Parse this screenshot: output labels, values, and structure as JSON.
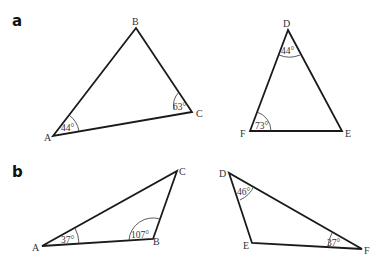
{
  "panels": [
    {
      "label": "a",
      "triangles": [
        {
          "vertices": {
            "A": "A",
            "B": "B",
            "C": "C"
          },
          "angles": [
            {
              "at": "A",
              "value": "44°"
            },
            {
              "at": "C",
              "value": "63°"
            }
          ]
        },
        {
          "vertices": {
            "D": "D",
            "E": "E",
            "F": "F"
          },
          "angles": [
            {
              "at": "D",
              "value": "44°"
            },
            {
              "at": "F",
              "value": "73°"
            }
          ]
        }
      ]
    },
    {
      "label": "b",
      "triangles": [
        {
          "vertices": {
            "A": "A",
            "B": "B",
            "C": "C"
          },
          "angles": [
            {
              "at": "A",
              "value": "37°"
            },
            {
              "at": "B",
              "value": "107°"
            }
          ]
        },
        {
          "vertices": {
            "D": "D",
            "E": "E",
            "F": "F"
          },
          "angles": [
            {
              "at": "D",
              "value": "46°"
            },
            {
              "at": "F",
              "value": "37°"
            }
          ]
        }
      ]
    }
  ]
}
